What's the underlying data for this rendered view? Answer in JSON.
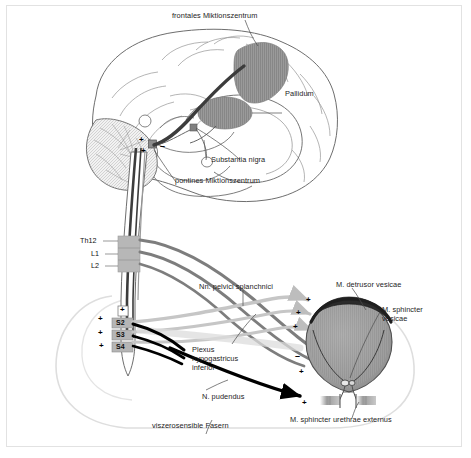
{
  "figure": {
    "language": "de",
    "background_color": "#ffffff",
    "border_color": "#e2e2e2"
  },
  "colors": {
    "outline": "#5a5a5a",
    "brain_outline": "#6e6e6e",
    "shaded_region": "#8f8f8f",
    "dark_tract": "#3c3c3c",
    "mid_gray_nerve": "#7d7d7d",
    "light_gray_nerve": "#c3c3c3",
    "black_nerve": "#000000",
    "bladder_fill": "#9b9b9b",
    "detrusor_cap": "#2b2b2b",
    "label_text": "#1d1d1d",
    "pelvis_outline": "#d8d8d8"
  },
  "labels": {
    "frontal_center": "frontales Miktionszentrum",
    "pallidum": "Pallidum",
    "substantia_nigra": "Substantia nigra",
    "pontine_center": "pontines Miktionszentrum",
    "pelvic_splanchnic": "Nn. pelvici splanchnici",
    "hypogastric_plexus": "Plexus\nhypogastricus\ninferior",
    "pudendal_nerve": "N. pudendus",
    "detrusor": "M. detrusor vesicae",
    "sphincter_vesicae": "M. sphincter\nvesicae",
    "sphincter_urethrae": "M. sphincter urethrae externus",
    "viscerosensible": "viszerosensible Fasern"
  },
  "spinal_segments": [
    {
      "label": "Th12",
      "level": "thoracic"
    },
    {
      "label": "L1",
      "level": "lumbar"
    },
    {
      "label": "L2",
      "level": "lumbar"
    },
    {
      "label": "S2",
      "level": "sacral"
    },
    {
      "label": "S3",
      "level": "sacral"
    },
    {
      "label": "S4",
      "level": "sacral"
    }
  ],
  "signs": {
    "brainstem_plus_left": "+",
    "brainstem_plus_lower": "+",
    "brainstem_minus": "–",
    "cord_plus_top": "+",
    "s2_plus": "+",
    "s3_plus": "+",
    "s4_plus": "+",
    "detrusor_plus_1": "+",
    "detrusor_plus_2": "+",
    "detrusor_plus_3": "+",
    "sphincter_vesicae_minus": "–",
    "sphincter_vesicae_plus": "+",
    "sphincter_urethrae_plus": "+"
  },
  "structures": {
    "brain": "mid-sagittal cerebrum with gyri",
    "cerebellum": "cerebellum hatched",
    "brainstem": "brainstem and spinal cord",
    "bladder": "urinary bladder teardrop",
    "urethra": "urethra with external sphincter",
    "pelvis": "pelvic outline faint"
  }
}
